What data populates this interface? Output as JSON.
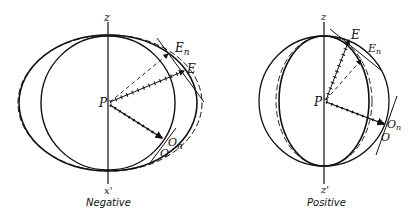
{
  "figures": [
    {
      "id": "negative",
      "caption": "Negative",
      "axis_top_label": "z",
      "axis_bottom_label": "z'",
      "center_label": "P",
      "points": {
        "E": "E",
        "En": "En",
        "O": "O",
        "On": "On"
      }
    },
    {
      "id": "positive",
      "caption": "Positive",
      "axis_top_label": "z",
      "axis_bottom_label": "z'",
      "center_label": "P",
      "points": {
        "E": "E",
        "En": "En",
        "O": "O",
        "On": "On"
      }
    }
  ],
  "labels": {
    "neg_z": "z",
    "neg_z_prime": "x'",
    "neg_P": "P",
    "neg_E": "E",
    "neg_En_main": "E",
    "neg_En_sub": "n",
    "neg_O": "O",
    "neg_On_main": "O",
    "neg_On_sub": "n",
    "neg_caption": "Negative",
    "pos_z": "z",
    "pos_z_prime": "z'",
    "pos_P": "P",
    "pos_E": "E",
    "pos_En_main": "E",
    "pos_En_sub": "n",
    "pos_O": "O",
    "pos_On_main": "O",
    "pos_On_sub": "n",
    "pos_caption": "Positive"
  }
}
